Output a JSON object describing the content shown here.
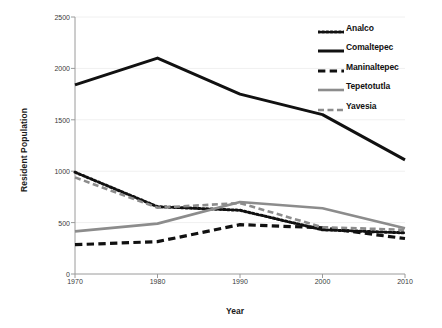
{
  "chart_data": {
    "type": "line",
    "title": "",
    "xlabel": "Year",
    "ylabel": "Resident Population",
    "x": [
      1970,
      1980,
      1990,
      2000,
      2010
    ],
    "xticklabels": [
      "1970",
      "1980",
      "1990",
      "2000",
      "2010"
    ],
    "yticks": [
      0,
      500,
      1000,
      1500,
      2000,
      2500
    ],
    "yticklabels": [
      "0",
      "500",
      "1000",
      "1500",
      "2000",
      "2500"
    ],
    "ylim": [
      0,
      2500
    ],
    "grid": false,
    "legend_position": "top-right",
    "series": [
      {
        "name": "Analco",
        "values": [
          990,
          655,
          620,
          430,
          400
        ],
        "color": "#111111",
        "linestyle": "dotted",
        "width": 3
      },
      {
        "name": "Comaltepec",
        "values": [
          1840,
          2100,
          1750,
          1550,
          1110
        ],
        "color": "#111111",
        "linestyle": "solid",
        "width": 3
      },
      {
        "name": "Maninaltepec",
        "values": [
          285,
          315,
          480,
          450,
          345
        ],
        "color": "#111111",
        "linestyle": "dashed",
        "width": 3.2
      },
      {
        "name": "Tepetotutla",
        "values": [
          415,
          490,
          700,
          640,
          445
        ],
        "color": "#8c8c8c",
        "linestyle": "solid",
        "width": 2.6
      },
      {
        "name": "Yavesia",
        "values": [
          940,
          645,
          690,
          455,
          430
        ],
        "color": "#8c8c8c",
        "linestyle": "dashed",
        "width": 2.6
      }
    ]
  },
  "axes": {
    "y_title": "Resident Population",
    "x_title": "Year",
    "axis_color": "#9a9a9a"
  },
  "legend": {
    "entries": [
      {
        "label": "Analco"
      },
      {
        "label": "Comaltepec"
      },
      {
        "label": "Maninaltepec"
      },
      {
        "label": "Tepetotutla"
      },
      {
        "label": "Yavesia"
      }
    ]
  }
}
